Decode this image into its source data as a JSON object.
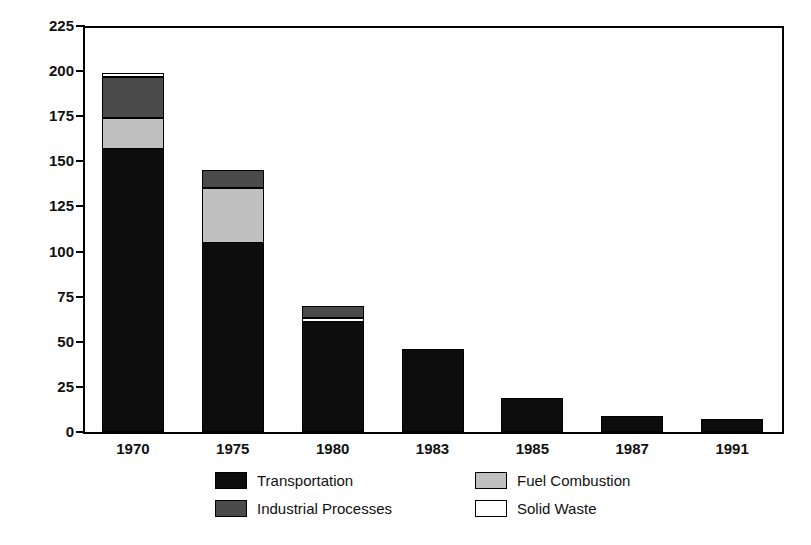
{
  "chart_data": {
    "type": "bar",
    "subtype": "stacked-bar",
    "title": "",
    "xlabel": "",
    "ylabel": "Million Metric Tons",
    "categories": [
      "1970",
      "1975",
      "1980",
      "1983",
      "1985",
      "1987",
      "1991"
    ],
    "ylim": [
      0,
      225
    ],
    "yticks": [
      0,
      25,
      50,
      75,
      100,
      125,
      150,
      175,
      200,
      225
    ],
    "ytick_labels": [
      "0",
      "25",
      "50",
      "75",
      "100",
      "125",
      "150",
      "175",
      "200",
      "225"
    ],
    "grid": false,
    "legend_position": "bottom",
    "series": [
      {
        "name": "Transportation",
        "color": "#0d0d0d",
        "values": [
          157,
          105,
          61,
          46,
          19,
          9,
          7
        ]
      },
      {
        "name": "Fuel Combustion",
        "color": "#c0c0c0",
        "values": [
          17,
          30,
          0,
          0,
          0,
          0,
          0
        ]
      },
      {
        "name": "Solid Waste",
        "color": "#ffffff",
        "values": [
          0,
          0,
          1.5,
          0,
          0,
          0,
          0
        ]
      },
      {
        "name": "Industrial Processes",
        "color": "#4a4a4a",
        "values": [
          24,
          10,
          7.5,
          0,
          0,
          0,
          0
        ]
      }
    ],
    "stack_order": [
      "Transportation",
      "Fuel Combustion",
      "Solid Waste",
      "Industrial Processes"
    ],
    "totals": [
      199,
      145,
      70,
      46,
      19,
      9,
      7
    ],
    "stacks": [
      {
        "category": "1970",
        "total": 199,
        "segments": [
          {
            "series": "Transportation",
            "from": 0,
            "to": 157,
            "value": 157,
            "color": "#0d0d0d"
          },
          {
            "series": "Fuel Combustion",
            "from": 157,
            "to": 174,
            "value": 17,
            "color": "#c0c0c0"
          },
          {
            "series": "Industrial Processes",
            "from": 174,
            "to": 197,
            "value": 23,
            "color": "#4a4a4a"
          },
          {
            "series": "Solid Waste",
            "from": 197,
            "to": 199,
            "value": 2,
            "color": "#ffffff"
          }
        ]
      },
      {
        "category": "1975",
        "total": 145,
        "segments": [
          {
            "series": "Transportation",
            "from": 0,
            "to": 105,
            "value": 105,
            "color": "#0d0d0d"
          },
          {
            "series": "Fuel Combustion",
            "from": 105,
            "to": 135,
            "value": 30,
            "color": "#c0c0c0"
          },
          {
            "series": "Industrial Processes",
            "from": 135,
            "to": 145,
            "value": 10,
            "color": "#4a4a4a"
          }
        ]
      },
      {
        "category": "1980",
        "total": 70,
        "segments": [
          {
            "series": "Transportation",
            "from": 0,
            "to": 61,
            "value": 61,
            "color": "#0d0d0d"
          },
          {
            "series": "Solid Waste",
            "from": 61,
            "to": 63,
            "value": 2,
            "color": "#ffffff"
          },
          {
            "series": "Industrial Processes",
            "from": 63,
            "to": 70,
            "value": 7,
            "color": "#4a4a4a"
          }
        ]
      },
      {
        "category": "1983",
        "total": 46,
        "segments": [
          {
            "series": "Transportation",
            "from": 0,
            "to": 46,
            "value": 46,
            "color": "#0d0d0d"
          }
        ]
      },
      {
        "category": "1985",
        "total": 19,
        "segments": [
          {
            "series": "Transportation",
            "from": 0,
            "to": 19,
            "value": 19,
            "color": "#0d0d0d"
          }
        ]
      },
      {
        "category": "1987",
        "total": 9,
        "segments": [
          {
            "series": "Transportation",
            "from": 0,
            "to": 9,
            "value": 9,
            "color": "#0d0d0d"
          }
        ]
      },
      {
        "category": "1991",
        "total": 7,
        "segments": [
          {
            "series": "Transportation",
            "from": 0,
            "to": 7,
            "value": 7,
            "color": "#0d0d0d"
          }
        ]
      }
    ]
  },
  "legend": {
    "entries": [
      {
        "label": "Transportation",
        "color": "#0d0d0d",
        "swatch": "sw-transportation"
      },
      {
        "label": "Fuel Combustion",
        "color": "#c0c0c0",
        "swatch": "sw-fuel"
      },
      {
        "label": "Industrial Processes",
        "color": "#4a4a4a",
        "swatch": "sw-industrial"
      },
      {
        "label": "Solid Waste",
        "color": "#ffffff",
        "swatch": "sw-waste"
      }
    ]
  },
  "axes": {
    "y_title": "Million Metric Tons"
  }
}
